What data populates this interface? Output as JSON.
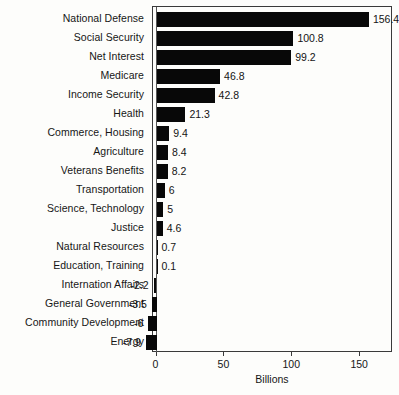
{
  "chart_data": {
    "type": "bar",
    "orientation": "horizontal",
    "title": "",
    "xlabel": "Billions",
    "ylabel": "",
    "xlim": [
      -10,
      176
    ],
    "xticks": [
      0,
      50,
      100,
      150
    ],
    "xtick_labels": [
      "0",
      "50",
      "100",
      "150"
    ],
    "grid": false,
    "legend": null,
    "bar_color": "#080808",
    "categories": [
      "National Defense",
      "Social Security",
      "Net Interest",
      "Medicare",
      "Income Security",
      "Health",
      "Commerce, Housing",
      "Agriculture",
      "Veterans Benefits",
      "Transportation",
      "Science, Technology",
      "Justice",
      "Natural Resources",
      "Education, Training",
      "Internation Affairs",
      "General Government",
      "Community Development",
      "Energy"
    ],
    "values": [
      156.4,
      100.8,
      99.2,
      46.8,
      42.8,
      21.3,
      9.4,
      8.4,
      8.2,
      6,
      5,
      4.6,
      0.7,
      0.1,
      -2.2,
      -3.5,
      -6,
      -7.9
    ],
    "value_labels": [
      "156.4",
      "100.8",
      "99.2",
      "46.8",
      "42.8",
      "21.3",
      "9.4",
      "8.4",
      "8.2",
      "6",
      "5",
      "4.6",
      "0.7",
      "0.1",
      "-2.2",
      "-3.5",
      "-6",
      "-7.9"
    ]
  },
  "axis": {
    "x_title": "Billions"
  },
  "artifacts": {
    "bottom_caption": ""
  }
}
